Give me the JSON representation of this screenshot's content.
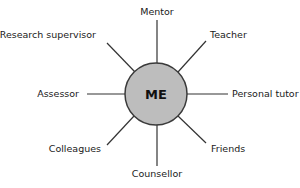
{
  "diagram": {
    "type": "hub-and-spoke",
    "center": {
      "label": "ME",
      "fill": "#bdbdbd",
      "stroke": "#3a3a3a",
      "cx": 156,
      "cy": 94,
      "r": 31
    },
    "line_color": "#333333",
    "text_color": "#1a1a1a",
    "nodes": [
      {
        "label": "Mentor",
        "position": "top"
      },
      {
        "label": "Teacher",
        "position": "top-right"
      },
      {
        "label": "Personal tutor",
        "position": "right"
      },
      {
        "label": "Friends",
        "position": "bottom-right"
      },
      {
        "label": "Counsellor",
        "position": "bottom"
      },
      {
        "label": "Colleagues",
        "position": "bottom-left"
      },
      {
        "label": "Assessor",
        "position": "left"
      },
      {
        "label": "Research supervisor",
        "position": "top-left"
      }
    ]
  }
}
